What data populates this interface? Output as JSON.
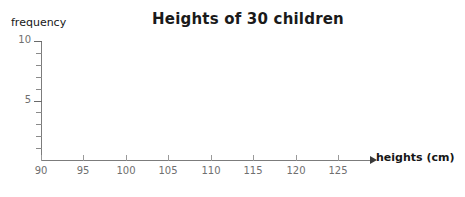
{
  "chart_data": {
    "type": "bar",
    "title": "Heights of 30 children",
    "xlabel": "heights (cm)",
    "ylabel": "frequency",
    "categories": [],
    "values": [],
    "series": [],
    "xlim": [
      90,
      129
    ],
    "ylim": [
      0,
      10
    ],
    "x_ticks": [
      "90",
      "95",
      "100",
      "105",
      "110",
      "115",
      "120",
      "125"
    ],
    "x_tick_values": [
      90,
      95,
      100,
      105,
      110,
      115,
      120,
      125
    ],
    "x_minor_step": 5,
    "y_ticks": [
      "5",
      "10"
    ],
    "y_tick_values": [
      5,
      10
    ],
    "y_minor_step": 1,
    "grid": false,
    "legend": null,
    "annotations": [],
    "note": "Empty axes template; no bars or data plotted in the plot area.",
    "colors": {
      "background": "#ffffff",
      "axis": "#7c7c7c",
      "tick_label": "#6f6f6f",
      "title": "#1a1a1a",
      "axis_title": "#161616",
      "arrow": "#3a3a3a"
    }
  }
}
